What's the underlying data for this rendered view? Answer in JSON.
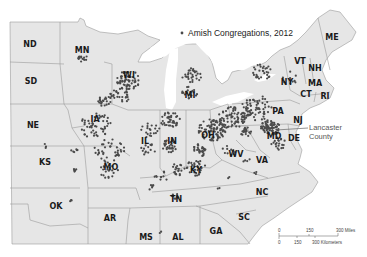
{
  "map": {
    "title": "Amish Congregations, 2012",
    "legend": {
      "symbol": "dot",
      "label": "Amish Congregations, 2012",
      "color": "#4a4a4a"
    },
    "annotation": {
      "line1": "Lancaster",
      "line2": "County"
    },
    "states": [
      {
        "abbr": "ND",
        "x": 30,
        "y": 47
      },
      {
        "abbr": "MN",
        "x": 82,
        "y": 53
      },
      {
        "abbr": "SD",
        "x": 31,
        "y": 84
      },
      {
        "abbr": "WI",
        "x": 129,
        "y": 78
      },
      {
        "abbr": "MI",
        "x": 190,
        "y": 98
      },
      {
        "abbr": "NE",
        "x": 33,
        "y": 128
      },
      {
        "abbr": "IA",
        "x": 95,
        "y": 122
      },
      {
        "abbr": "IL",
        "x": 145,
        "y": 144
      },
      {
        "abbr": "IN",
        "x": 172,
        "y": 144
      },
      {
        "abbr": "OH",
        "x": 208,
        "y": 138
      },
      {
        "abbr": "PA",
        "x": 278,
        "y": 114
      },
      {
        "abbr": "NY",
        "x": 287,
        "y": 85
      },
      {
        "abbr": "VT",
        "x": 300,
        "y": 64
      },
      {
        "abbr": "NH",
        "x": 315,
        "y": 71
      },
      {
        "abbr": "ME",
        "x": 332,
        "y": 40
      },
      {
        "abbr": "MA",
        "x": 315,
        "y": 86
      },
      {
        "abbr": "CT",
        "x": 306,
        "y": 97
      },
      {
        "abbr": "RI",
        "x": 325,
        "y": 99
      },
      {
        "abbr": "NJ",
        "x": 298,
        "y": 123
      },
      {
        "abbr": "MD",
        "x": 274,
        "y": 139
      },
      {
        "abbr": "DE",
        "x": 294,
        "y": 141
      },
      {
        "abbr": "WV",
        "x": 236,
        "y": 157
      },
      {
        "abbr": "VA",
        "x": 262,
        "y": 163
      },
      {
        "abbr": "KS",
        "x": 45,
        "y": 165
      },
      {
        "abbr": "MO",
        "x": 111,
        "y": 170
      },
      {
        "abbr": "KY",
        "x": 196,
        "y": 173
      },
      {
        "abbr": "OK",
        "x": 56,
        "y": 209
      },
      {
        "abbr": "AR",
        "x": 110,
        "y": 221
      },
      {
        "abbr": "TN",
        "x": 176,
        "y": 202
      },
      {
        "abbr": "NC",
        "x": 262,
        "y": 195
      },
      {
        "abbr": "SC",
        "x": 244,
        "y": 220
      },
      {
        "abbr": "GA",
        "x": 216,
        "y": 234
      },
      {
        "abbr": "MS",
        "x": 146,
        "y": 240
      },
      {
        "abbr": "AL",
        "x": 178,
        "y": 240
      }
    ],
    "scale_bar": {
      "miles": {
        "ticks": [
          "0",
          "150",
          "300 Miles"
        ]
      },
      "kilometers": {
        "ticks": [
          "0",
          "150",
          "300 Kilometers"
        ]
      }
    }
  }
}
